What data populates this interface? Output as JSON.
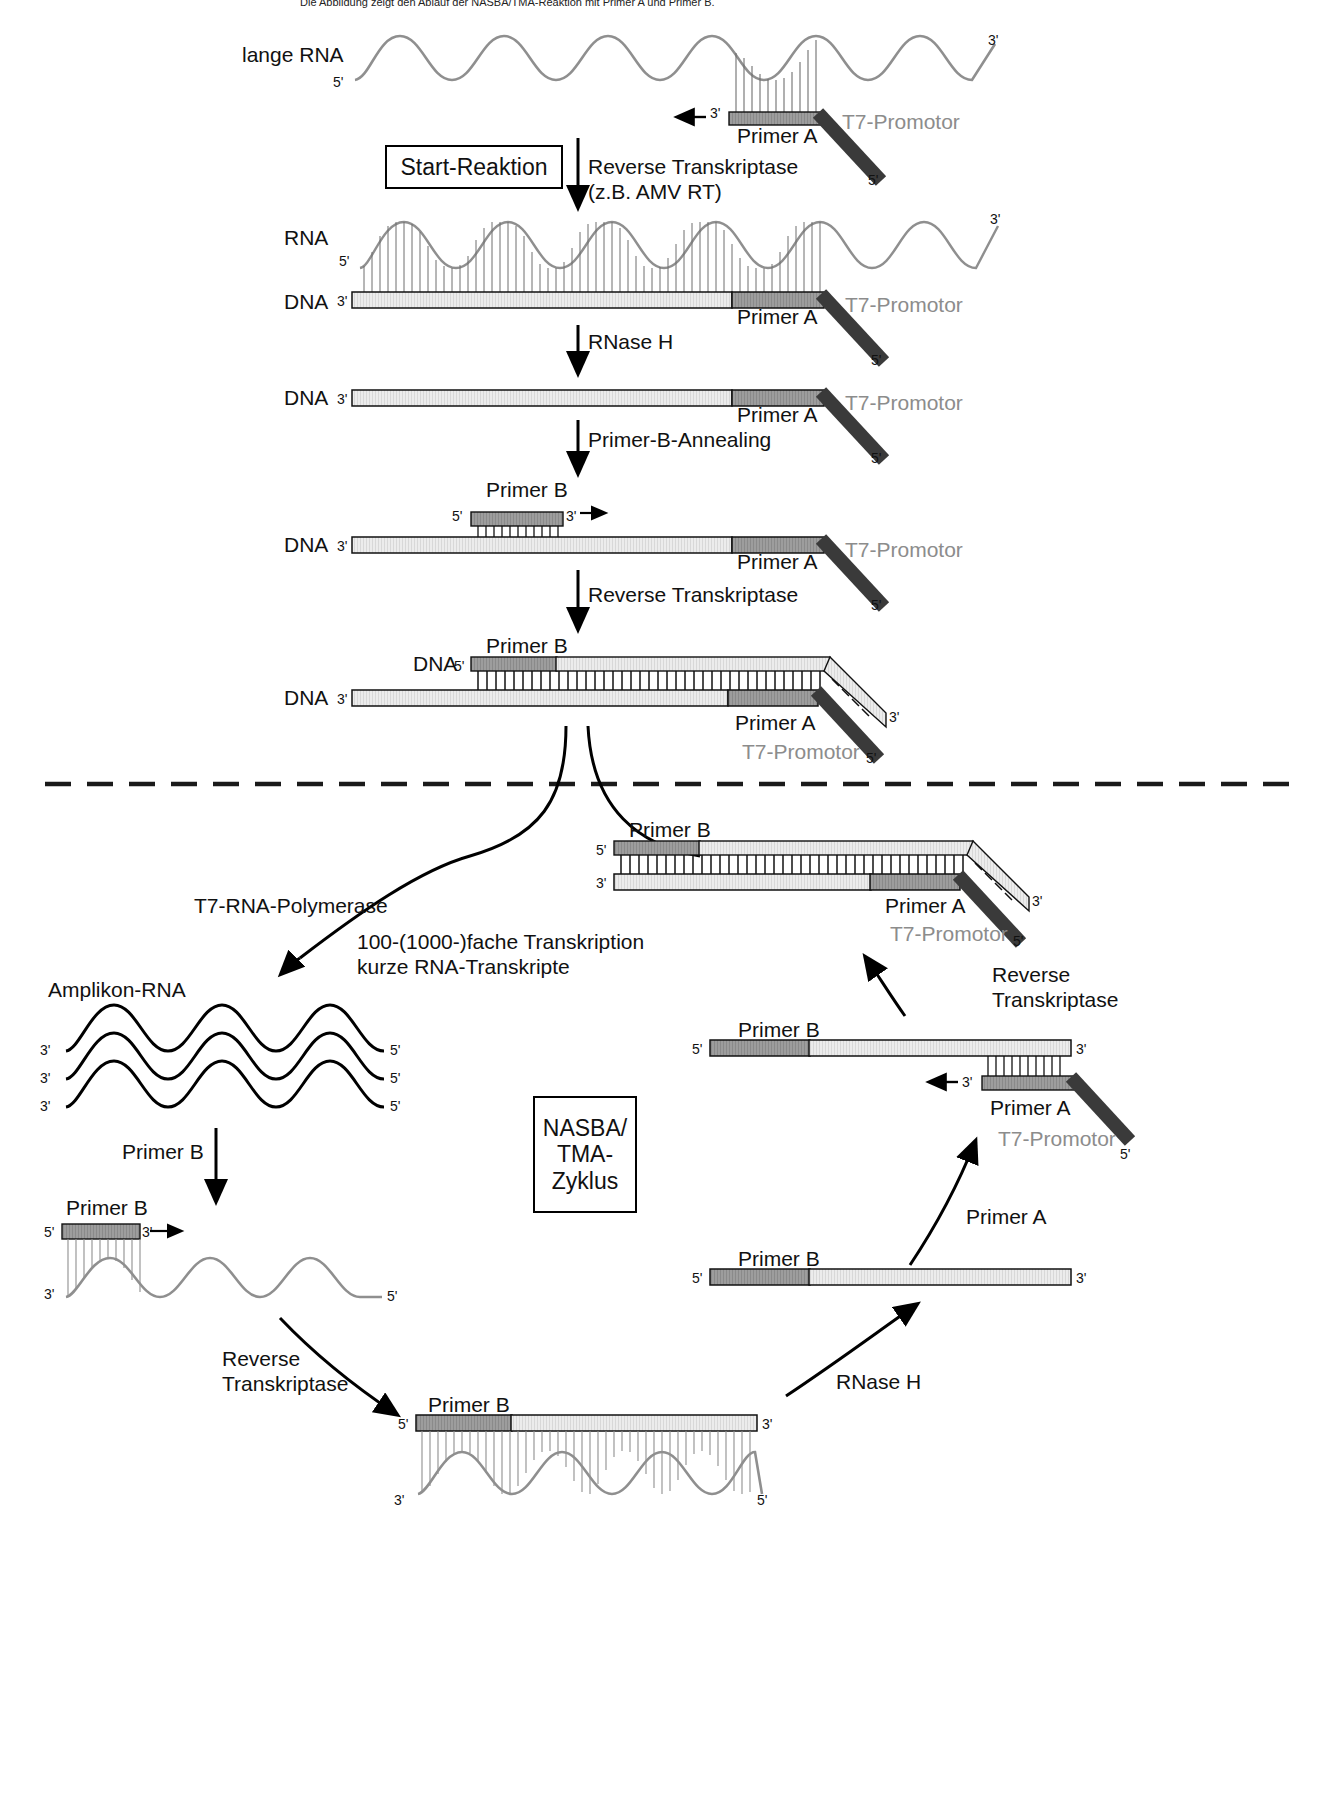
{
  "figure": {
    "title_cut": "Die Abbildung zeigt den Ablauf der NASBA/TMA-Reaktion mit Primer A und Primer B.",
    "boxes": [
      {
        "id": "start-reaktion",
        "text": "Start-Reaktion"
      },
      {
        "id": "nasba-tma-zyklus",
        "text": "NASBA/\nTMA-\nZyklus"
      }
    ]
  },
  "steps": {
    "reverse_transkriptase_amv": "Reverse Transkriptase\n(z.B. AMV RT)",
    "rnase_h": "RNase H",
    "primer_b_annealing": "Primer-B-Annealing",
    "reverse_transkriptase": "Reverse Transkriptase",
    "t7_rna_polymerase": "T7-RNA-Polymerase",
    "transcription_note": "100-(1000-)fache Transkription\nkurze RNA-Transkripte",
    "reverse_transkriptase_2": "Reverse\nTranskriptase",
    "primer_a_step": "Primer A",
    "primer_b_step": "Primer B",
    "rnase_h_2": "RNase H",
    "reverse_transkriptase_3": "Reverse\nTranskriptase"
  },
  "molecules": {
    "lange_rna": "lange RNA",
    "rna": "RNA",
    "dna": "DNA",
    "amplikon_rna": "Amplikon-RNA"
  },
  "primers": {
    "primer_a": "Primer A",
    "primer_b": "Primer B",
    "t7_promotor": "T7-Promotor"
  },
  "ends": {
    "five_prime": "5'",
    "three_prime": "3'"
  },
  "colors": {
    "rna_strand": "#8f8f8f",
    "dna_fill": "#e8e8e8",
    "primer_fill": "#9a9a9a",
    "promotor_fill": "#3a3a3a",
    "ink": "#111111",
    "gray_text": "#8c8c8c"
  },
  "panels": {
    "upper_label": "Start-Reaktion",
    "lower_label": "NASBA/TMA-Zyklus"
  }
}
